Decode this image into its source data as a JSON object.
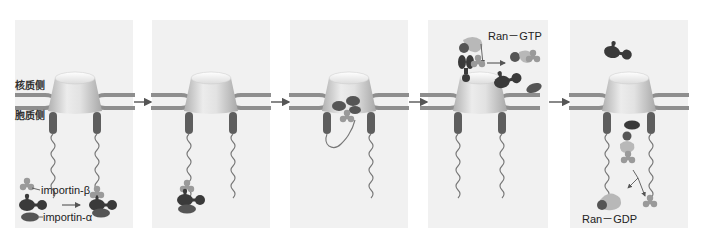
{
  "figure": {
    "side_labels": {
      "nucleus": "核质侧",
      "cytoplasm": "胞质侧"
    },
    "molecule_labels": {
      "importin_beta": "importin-β",
      "importin_alpha": "importin-α",
      "ran_gtp": "Ran－GTP",
      "ran_gdp": "Ran－GDP"
    },
    "panels": [
      {
        "index": 1,
        "x": 15,
        "width": 118,
        "stage": "importin-β binds importin-α/cargo in cytoplasm"
      },
      {
        "index": 2,
        "x": 152,
        "width": 118,
        "stage": "complex docks on cytoplasmic filament"
      },
      {
        "index": 3,
        "x": 290,
        "width": 118,
        "stage": "complex translocates through pore"
      },
      {
        "index": 4,
        "x": 428,
        "width": 120,
        "stage": "Ran-GTP releases cargo in nucleus"
      },
      {
        "index": 5,
        "x": 570,
        "width": 118,
        "stage": "importin recycled; Ran-GTP hydrolyzed to Ran-GDP"
      }
    ],
    "colors": {
      "panel_bg": "#f1f1f1",
      "membrane": "#8e8e8e",
      "pore_light": "#f4f4f4",
      "pore_dark": "#b5b5b5",
      "filament": "#5e5e5e",
      "cargo_dark": "#3a3a3a",
      "importin_alpha": "#555555",
      "importin_beta": "#9a9a9a",
      "ran": "#b8b8b8",
      "arrow": "#555555"
    }
  }
}
